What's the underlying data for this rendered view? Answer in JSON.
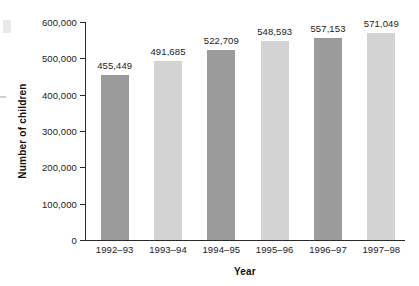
{
  "chart_data": {
    "type": "bar",
    "title": "",
    "subtitle": "",
    "xlabel": "Year",
    "ylabel": "Number of children",
    "categories": [
      "1992–93",
      "1993–94",
      "1994–95",
      "1995–96",
      "1996–97",
      "1997–98"
    ],
    "values": [
      455449,
      491685,
      522709,
      548593,
      557153,
      571049
    ],
    "value_labels": [
      "455,449",
      "491,685",
      "522,709",
      "548,593",
      "557,153",
      "571,049"
    ],
    "ylim": [
      0,
      600000
    ],
    "ytick_values": [
      0,
      100000,
      200000,
      300000,
      400000,
      500000,
      600000
    ],
    "ytick_labels": [
      "0",
      "100,000",
      "200,000",
      "300,000",
      "400,000",
      "500,000",
      "600,000"
    ],
    "grid": false,
    "legend": null,
    "legend_position": "none",
    "bar_colors": [
      "#9b9b9b",
      "#d3d3d3",
      "#9b9b9b",
      "#d3d3d3",
      "#9b9b9b",
      "#d3d3d3"
    ],
    "axis_color": "#2b2b2b",
    "background": "#ffffff"
  }
}
